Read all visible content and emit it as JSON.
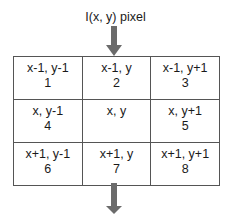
{
  "title": "I(x, y) pixel",
  "arrows": {
    "color": "#6b6b6b",
    "direction": "down"
  },
  "grid": {
    "rows": [
      [
        {
          "coord": "x-1, y-1",
          "index": "1"
        },
        {
          "coord": "x-1, y",
          "index": "2"
        },
        {
          "coord": "x-1, y+1",
          "index": "3"
        }
      ],
      [
        {
          "coord": "x, y-1",
          "index": "4"
        },
        {
          "coord": "x, y",
          "index": ""
        },
        {
          "coord": "x, y+1",
          "index": "5"
        }
      ],
      [
        {
          "coord": "x+1, y-1",
          "index": "6"
        },
        {
          "coord": "x+1, y",
          "index": "7"
        },
        {
          "coord": "x+1, y+1",
          "index": "8"
        }
      ]
    ]
  }
}
